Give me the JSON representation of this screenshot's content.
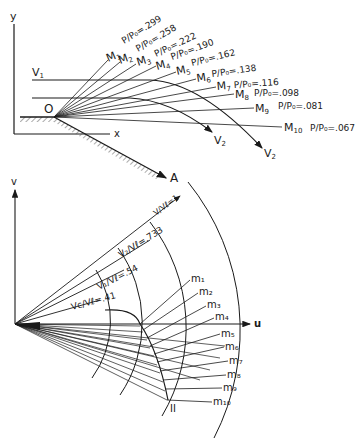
{
  "top_diagram": {
    "axis_y_label": "y",
    "axis_x_label": "x",
    "origin_label": "O",
    "wall_label": "A",
    "v1_label": "V",
    "v1_sub": "1",
    "v2_labels": [
      {
        "main": "V",
        "sub": "2"
      },
      {
        "main": "V",
        "sub": "2"
      }
    ],
    "mach_lines": [
      {
        "label": "M",
        "sub": "1",
        "ratio": "P/P₀=.299"
      },
      {
        "label": "M",
        "sub": "2",
        "ratio": "P/P₀=.258"
      },
      {
        "label": "M",
        "sub": "3",
        "ratio": "P/P₀=.222"
      },
      {
        "label": "M",
        "sub": "4",
        "ratio": "P/P₀=.190"
      },
      {
        "label": "M",
        "sub": "5",
        "ratio": "P/P₀=.162"
      },
      {
        "label": "M",
        "sub": "6",
        "ratio": "P/P₀=.138"
      },
      {
        "label": "M",
        "sub": "7",
        "ratio": "P/P₀=.116"
      },
      {
        "label": "M",
        "sub": "8",
        "ratio": "P/P₀=.098"
      },
      {
        "label": "M",
        "sub": "9",
        "ratio": "P/P₀=.081"
      },
      {
        "label": "M",
        "sub": "10",
        "ratio": "P/P₀=.067"
      }
    ]
  },
  "bottom_diagram": {
    "axis_v_label": "v",
    "axis_u_label": "u",
    "curve_label": "II",
    "circles": [
      {
        "label": "Vc/Vℓ = .41"
      },
      {
        "label": "V1/Vℓ = .54"
      },
      {
        "label": "V2/Vℓ = .733"
      },
      {
        "label": "V/Vℓ = 1"
      }
    ],
    "circle_ratios": {
      "c": ".41",
      "one": ".54",
      "two": ".733",
      "l": "1"
    },
    "m_labels": [
      "m₁",
      "m₂",
      "m₃",
      "m₄",
      "m₅",
      "m₆",
      "m₇",
      "m₈",
      "m₉",
      "m₁₀"
    ]
  }
}
